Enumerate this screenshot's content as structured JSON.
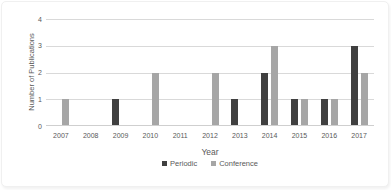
{
  "chart_data": {
    "type": "bar",
    "title": "",
    "xlabel": "Year",
    "ylabel": "Number of Publications",
    "categories": [
      "2007",
      "2008",
      "2009",
      "2010",
      "2011",
      "2012",
      "2013",
      "2014",
      "2015",
      "2016",
      "2017"
    ],
    "series": [
      {
        "name": "Periodic",
        "color": "#404040",
        "values": [
          0,
          0,
          1,
          0,
          0,
          0,
          1,
          2,
          1,
          1,
          3
        ]
      },
      {
        "name": "Conference",
        "color": "#a6a6a6",
        "values": [
          1,
          0,
          0,
          2,
          0,
          2,
          0,
          3,
          1,
          1,
          2
        ]
      }
    ],
    "ylim": [
      0,
      4
    ],
    "yticks": [
      0,
      1,
      2,
      3,
      4
    ],
    "grid": true,
    "legend_position": "bottom"
  },
  "styles": {
    "background": "#ffffff",
    "text_color": "#595959",
    "gridline_color": "#d9d9d9",
    "axis_line_color": "#cfcfcf"
  }
}
